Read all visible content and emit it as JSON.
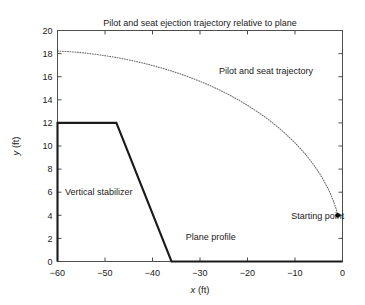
{
  "chart_data": {
    "type": "line",
    "title": "Pilot and seat ejection trajectory relative to plane",
    "xlabel_var": "x",
    "xlabel_unit": "(ft)",
    "ylabel_var": "y",
    "ylabel_unit": "(ft)",
    "xlim": [
      -60,
      0
    ],
    "ylim": [
      0,
      20
    ],
    "xticks": [
      -60,
      -50,
      -40,
      -30,
      -20,
      -10,
      0
    ],
    "xtick_labels": [
      "−60",
      "−50",
      "−40",
      "−30",
      "−20",
      "−10",
      "0"
    ],
    "yticks": [
      0,
      2,
      4,
      6,
      8,
      10,
      12,
      14,
      16,
      18,
      20
    ],
    "ytick_labels": [
      "0",
      "2",
      "4",
      "6",
      "8",
      "10",
      "12",
      "14",
      "16",
      "18",
      "20"
    ],
    "grid": false,
    "legend": "none",
    "series": [
      {
        "name": "Pilot and seat trajectory",
        "style": "dotted",
        "color": "#666666",
        "points": [
          [
            -60.0,
            18.22
          ],
          [
            -58.0,
            18.18
          ],
          [
            -56.0,
            18.12
          ],
          [
            -54.0,
            18.04
          ],
          [
            -52.0,
            17.94
          ],
          [
            -50.0,
            17.82
          ],
          [
            -48.0,
            17.69
          ],
          [
            -46.0,
            17.54
          ],
          [
            -44.0,
            17.37
          ],
          [
            -42.0,
            17.18
          ],
          [
            -40.0,
            16.97
          ],
          [
            -38.0,
            16.74
          ],
          [
            -36.0,
            16.49
          ],
          [
            -34.0,
            16.22
          ],
          [
            -32.0,
            15.92
          ],
          [
            -30.0,
            15.6
          ],
          [
            -28.0,
            15.25
          ],
          [
            -26.0,
            14.87
          ],
          [
            -24.0,
            14.46
          ],
          [
            -22.0,
            14.01
          ],
          [
            -20.0,
            13.52
          ],
          [
            -18.0,
            12.99
          ],
          [
            -16.0,
            12.41
          ],
          [
            -14.0,
            11.77
          ],
          [
            -12.0,
            11.06
          ],
          [
            -10.0,
            10.27
          ],
          [
            -9.0,
            9.84
          ],
          [
            -8.0,
            9.38
          ],
          [
            -7.0,
            8.88
          ],
          [
            -6.0,
            8.33
          ],
          [
            -5.0,
            7.73
          ],
          [
            -4.0,
            7.05
          ],
          [
            -3.0,
            6.27
          ],
          [
            -2.5,
            5.83
          ],
          [
            -2.0,
            5.33
          ],
          [
            -1.7,
            5.0
          ],
          [
            -1.4,
            4.63
          ],
          [
            -1.2,
            4.36
          ],
          [
            -1.05,
            4.13
          ],
          [
            -1.0,
            4.0
          ]
        ]
      },
      {
        "name": "Plane profile",
        "style": "solid",
        "color": "#1a1a1a",
        "points": [
          [
            -60.0,
            0.0
          ],
          [
            -60.0,
            12.0
          ],
          [
            -47.6,
            12.0
          ],
          [
            -36.0,
            0.0
          ],
          [
            0.0,
            0.0
          ]
        ]
      }
    ],
    "markers": [
      {
        "name": "Starting point",
        "x": -1.0,
        "y": 4.0,
        "shape": "filled-circle",
        "color": "#000000",
        "radius_px": 2.4
      }
    ],
    "annotations": [
      {
        "text": "Pilot and seat trajectory",
        "x": -26.0,
        "y": 16.55,
        "anchor": "start"
      },
      {
        "text": "Vertical stabilizer",
        "x": -58.4,
        "y": 6.0,
        "anchor": "start"
      },
      {
        "text": "Plane profile",
        "x": -33.0,
        "y": 2.15,
        "anchor": "start"
      },
      {
        "text": "Starting point",
        "x": -10.8,
        "y": 4.0,
        "anchor": "start"
      }
    ]
  },
  "colors": {
    "frame": "#4d4d4d",
    "profile": "#1a1a1a",
    "trajectory": "#666666",
    "marker": "#000000",
    "text": "#1a1a1a",
    "background": "#ffffff"
  }
}
